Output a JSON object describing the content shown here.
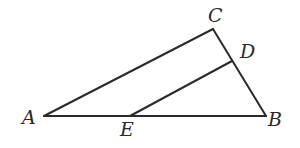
{
  "diagram": {
    "type": "geometry-triangle",
    "stroke_color": "#2a2a2a",
    "background": "#ffffff",
    "points": {
      "A": {
        "x": 44,
        "y": 116,
        "label": "A",
        "label_x": 22,
        "label_y": 124
      },
      "B": {
        "x": 266,
        "y": 116,
        "label": "B",
        "label_x": 268,
        "label_y": 126
      },
      "C": {
        "x": 213,
        "y": 29,
        "label": "C",
        "label_x": 208,
        "label_y": 22
      },
      "D": {
        "x": 232,
        "y": 61,
        "label": "D",
        "label_x": 240,
        "label_y": 58
      },
      "E": {
        "x": 130,
        "y": 116,
        "label": "E",
        "label_x": 120,
        "label_y": 136
      }
    },
    "segments": [
      {
        "from": "A",
        "to": "B"
      },
      {
        "from": "A",
        "to": "C"
      },
      {
        "from": "C",
        "to": "B"
      },
      {
        "from": "E",
        "to": "D"
      }
    ]
  }
}
